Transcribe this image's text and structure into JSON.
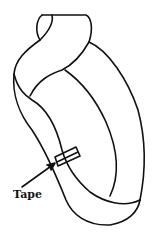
{
  "diagram": {
    "labels": {
      "tape": "Tape"
    },
    "colors": {
      "stroke": "#111111",
      "background": "#ffffff"
    }
  }
}
